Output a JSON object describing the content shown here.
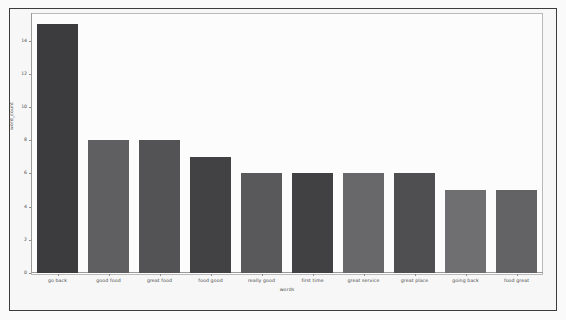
{
  "figure": {
    "caption": "",
    "background_color": "#fafafa",
    "frame_color": "#3c3c3c",
    "panel_color": "#fcfcfc",
    "panel_border_color": "#b9b9b9",
    "axis_color": "#9a9a9a"
  },
  "chart_data": {
    "type": "bar",
    "title": "",
    "xlabel": "words",
    "ylabel": "word_count",
    "categories": [
      "go back",
      "good food",
      "great food",
      "food good",
      "really good",
      "first time",
      "great service",
      "great place",
      "going back",
      "food great"
    ],
    "values": [
      15,
      8,
      8,
      7,
      6,
      6,
      6,
      6,
      5,
      5
    ],
    "bar_colors": [
      "#3c3c3e",
      "#5f5f61",
      "#535356",
      "#424245",
      "#59595c",
      "#414144",
      "#68686a",
      "#4f4f52",
      "#6f6f71",
      "#636365"
    ],
    "ylim": [
      0,
      15.6
    ],
    "yticks": [
      0,
      2,
      4,
      6,
      8,
      10,
      12,
      14
    ],
    "ytick_labels": [
      "0",
      "2",
      "4",
      "6",
      "8",
      "10",
      "12",
      "14"
    ],
    "grid": false,
    "legend": false,
    "orientation": "vertical"
  }
}
